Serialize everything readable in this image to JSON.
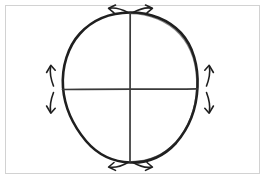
{
  "image": {
    "title": "Hand-drawn circle with crosshair axes and four outward double arrows",
    "width": 265,
    "height": 179,
    "background_color": "#fdfdfd",
    "paper_color": "#ffffff"
  },
  "frame": {
    "name": "image-border",
    "stroke_color": "#d0d0d0",
    "stroke_width": 1,
    "x": 5,
    "y": 5,
    "width": 255,
    "height": 169
  },
  "diagram": {
    "type": "sketch",
    "ink_color": "#1c1c1c",
    "circle": {
      "label": "hand-drawn circle",
      "center_x": 130,
      "center_y": 87,
      "radius_x": 68,
      "radius_y": 75,
      "stroke_width": 2.4
    },
    "axes": {
      "vertical": {
        "label": "vertical diameter",
        "x": 130,
        "y_top": 13,
        "y_bottom": 162,
        "stroke_width": 1.5
      },
      "horizontal": {
        "label": "horizontal diameter",
        "y": 89,
        "x_left": 62,
        "x_right": 197,
        "stroke_width": 1.5
      }
    },
    "arrows": [
      {
        "id": "top-left-arrow",
        "label": "top arrow pointing left",
        "direction": "left",
        "position": "top",
        "stroke_width": 1.5
      },
      {
        "id": "top-right-arrow",
        "label": "top arrow pointing right",
        "direction": "right",
        "position": "top",
        "stroke_width": 1.5
      },
      {
        "id": "bottom-left-arrow",
        "label": "bottom arrow pointing left",
        "direction": "left",
        "position": "bottom",
        "stroke_width": 1.5
      },
      {
        "id": "bottom-right-arrow",
        "label": "bottom arrow pointing right",
        "direction": "right",
        "position": "bottom",
        "stroke_width": 1.5
      },
      {
        "id": "left-up-arrow",
        "label": "left arrow pointing up",
        "direction": "up",
        "position": "left",
        "stroke_width": 1.5
      },
      {
        "id": "left-down-arrow",
        "label": "left arrow pointing down",
        "direction": "down",
        "position": "left",
        "stroke_width": 1.5
      },
      {
        "id": "right-up-arrow",
        "label": "right arrow pointing up",
        "direction": "up",
        "position": "right",
        "stroke_width": 1.5
      },
      {
        "id": "right-down-arrow",
        "label": "right arrow pointing down",
        "direction": "down",
        "position": "right",
        "stroke_width": 1.5
      }
    ]
  }
}
